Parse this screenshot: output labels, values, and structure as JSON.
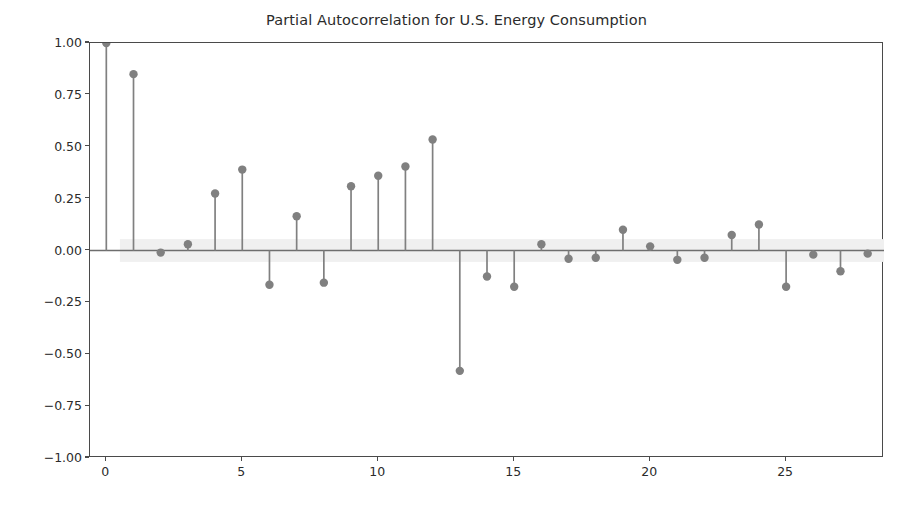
{
  "chart_data": {
    "type": "scatter",
    "title": "Partial Autocorrelation for U.S. Energy Consumption",
    "xlabel": "",
    "ylabel": "",
    "xlim": [
      -0.6,
      28.6
    ],
    "ylim": [
      -1.0,
      1.0
    ],
    "grid": false,
    "legend": null,
    "plot_style": "stem",
    "x": [
      0,
      1,
      2,
      3,
      4,
      5,
      6,
      7,
      8,
      9,
      10,
      11,
      12,
      13,
      14,
      15,
      16,
      17,
      18,
      19,
      20,
      21,
      22,
      23,
      24,
      25,
      26,
      27,
      28
    ],
    "values": [
      1.0,
      0.85,
      -0.01,
      0.03,
      0.275,
      0.39,
      -0.165,
      0.165,
      -0.155,
      0.31,
      0.36,
      0.405,
      0.535,
      -0.58,
      -0.125,
      -0.175,
      0.03,
      -0.04,
      -0.035,
      0.1,
      0.02,
      -0.045,
      -0.035,
      0.075,
      0.125,
      -0.175,
      -0.02,
      -0.1,
      -0.015
    ],
    "xticks": [
      0,
      5,
      10,
      15,
      20,
      25
    ],
    "xticklabels": [
      "0",
      "5",
      "10",
      "15",
      "20",
      "25"
    ],
    "yticks": [
      -1.0,
      -0.75,
      -0.5,
      -0.25,
      0.0,
      0.25,
      0.5,
      0.75,
      1.0
    ],
    "yticklabels": [
      "−1.00",
      "−0.75",
      "−0.50",
      "−0.25",
      "0.00",
      "0.25",
      "0.50",
      "0.75",
      "1.00"
    ],
    "confidence_band": {
      "x_start": 0.5,
      "x_end": 28.6,
      "upper": 0.055,
      "lower": -0.055,
      "color": "#f0f0f0"
    },
    "colors": {
      "marker": "#808080",
      "stem": "#808080",
      "baseline": "#6e6e6e",
      "axis": "#4a4a4a",
      "text": "#2b2b2b",
      "background": "#ffffff"
    }
  }
}
